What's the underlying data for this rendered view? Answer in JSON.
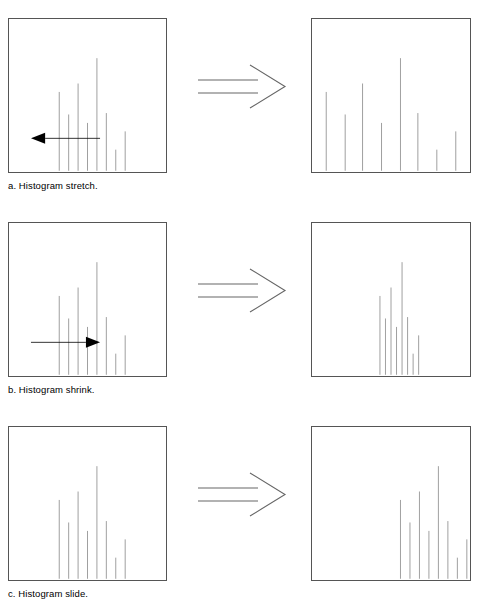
{
  "figure": {
    "width": 480,
    "height": 606,
    "background_color": "#ffffff",
    "box_border_color": "#555555",
    "bar_color": "#808080",
    "arrow_color": "#000000",
    "transition_arrow_color": "#666666"
  },
  "rows": [
    {
      "id": "a",
      "caption": "a. Histogram stretch.",
      "operation": "stretch",
      "left_panel": {
        "name": "input-histogram-stretch",
        "direction_arrows": [
          {
            "name": "arrow-left",
            "direction": "left",
            "x_start": 58,
            "x_end": 14,
            "y": 78
          },
          {
            "name": "arrow-right",
            "direction": "right",
            "x_start": 108,
            "x_end": 152,
            "y": 78
          }
        ]
      },
      "right_panel": {
        "name": "output-histogram-stretched"
      }
    },
    {
      "id": "b",
      "caption": "b. Histogram shrink.",
      "operation": "shrink",
      "left_panel": {
        "name": "input-histogram-shrink",
        "direction_arrows": [
          {
            "name": "arrow-right",
            "direction": "right",
            "x_start": 14,
            "x_end": 58,
            "y": 78
          },
          {
            "name": "arrow-left",
            "direction": "left",
            "x_start": 152,
            "x_end": 108,
            "y": 78
          }
        ]
      },
      "right_panel": {
        "name": "output-histogram-shrunk"
      }
    },
    {
      "id": "c",
      "caption": "c. Histogram slide.",
      "operation": "slide",
      "left_panel": {
        "name": "input-histogram-slide",
        "direction_arrows": [
          {
            "name": "arrow-right",
            "direction": "right",
            "x_start": 108,
            "x_end": 152,
            "y": 97
          }
        ]
      },
      "right_panel": {
        "name": "output-histogram-slid"
      }
    }
  ],
  "transition_arrow": {
    "name": "transition-arrow",
    "style": "open-outline-double-line-arrow",
    "direction": "right"
  },
  "chart_data": [
    {
      "id": "a-left",
      "type": "bar",
      "title": "Histogram stretch - input",
      "xlabel": "",
      "ylabel": "",
      "xlim": [
        0,
        100
      ],
      "ylim": [
        0,
        100
      ],
      "grid": false,
      "legend": "none",
      "x": [
        32,
        38,
        44,
        50,
        56,
        62,
        68,
        74
      ],
      "values": [
        56,
        40,
        62,
        34,
        80,
        41,
        15,
        28
      ]
    },
    {
      "id": "a-right",
      "type": "bar",
      "title": "Histogram stretch - output",
      "xlabel": "",
      "ylabel": "",
      "xlim": [
        0,
        100
      ],
      "ylim": [
        0,
        100
      ],
      "grid": false,
      "legend": "none",
      "x": [
        9,
        21,
        32,
        44,
        56,
        67,
        79,
        91
      ],
      "values": [
        56,
        40,
        62,
        34,
        80,
        41,
        15,
        28
      ]
    },
    {
      "id": "b-left",
      "type": "bar",
      "title": "Histogram shrink - input",
      "xlabel": "",
      "ylabel": "",
      "xlim": [
        0,
        100
      ],
      "ylim": [
        0,
        100
      ],
      "grid": false,
      "legend": "none",
      "x": [
        32,
        38,
        44,
        50,
        56,
        62,
        68,
        74
      ],
      "values": [
        56,
        40,
        62,
        34,
        80,
        41,
        15,
        28
      ]
    },
    {
      "id": "b-right",
      "type": "bar",
      "title": "Histogram shrink - output",
      "xlabel": "",
      "ylabel": "",
      "xlim": [
        0,
        100
      ],
      "ylim": [
        0,
        100
      ],
      "grid": false,
      "legend": "none",
      "x": [
        43,
        46.5,
        50,
        53.5,
        57,
        60.5,
        64,
        67.5
      ],
      "values": [
        56,
        40,
        62,
        34,
        80,
        41,
        15,
        28
      ]
    },
    {
      "id": "c-left",
      "type": "bar",
      "title": "Histogram slide - input",
      "xlabel": "",
      "ylabel": "",
      "xlim": [
        0,
        100
      ],
      "ylim": [
        0,
        100
      ],
      "grid": false,
      "legend": "none",
      "x": [
        32,
        38,
        44,
        50,
        56,
        62,
        68,
        74
      ],
      "values": [
        56,
        40,
        62,
        34,
        80,
        41,
        15,
        28
      ]
    },
    {
      "id": "c-right",
      "type": "bar",
      "title": "Histogram slide - output",
      "xlabel": "",
      "ylabel": "",
      "xlim": [
        0,
        100
      ],
      "ylim": [
        0,
        100
      ],
      "grid": false,
      "legend": "none",
      "x": [
        56,
        62,
        68,
        74,
        80,
        86,
        92,
        98
      ],
      "values": [
        56,
        40,
        62,
        34,
        80,
        41,
        15,
        28
      ]
    }
  ]
}
